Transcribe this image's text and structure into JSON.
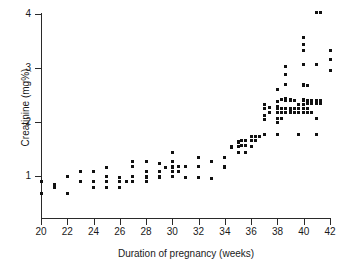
{
  "chart_data": {
    "type": "scatter",
    "title": "",
    "xlabel": "Duration of pregnancy (weeks)",
    "ylabel": "Creatinine (mg%)",
    "xlim": [
      20,
      42
    ],
    "ylim": [
      0.55,
      4.05
    ],
    "grid": false,
    "legend": null,
    "marker": "square",
    "marker_color": "#111111",
    "xticks": [
      20,
      22,
      24,
      26,
      28,
      30,
      32,
      34,
      36,
      38,
      40,
      42
    ],
    "xtick_labels": [
      "20",
      "22",
      "24",
      "26",
      "28",
      "30",
      "32",
      "34",
      "36",
      "38",
      "40",
      "42"
    ],
    "yticks": [
      1,
      2,
      3,
      4
    ],
    "ytick_labels": [
      "1",
      "2",
      "3",
      "4"
    ],
    "x_unit": "weeks",
    "y_unit": "mg%",
    "n_points": 154,
    "points": [
      [
        20.0,
        0.9
      ],
      [
        20.0,
        0.68
      ],
      [
        21.0,
        0.85
      ],
      [
        21.0,
        0.79
      ],
      [
        22.0,
        0.99
      ],
      [
        22.0,
        0.68
      ],
      [
        23.0,
        1.08
      ],
      [
        23.0,
        0.89
      ],
      [
        23.0,
        0.9
      ],
      [
        24.0,
        1.08
      ],
      [
        24.0,
        0.9
      ],
      [
        24.0,
        0.79
      ],
      [
        25.0,
        1.16
      ],
      [
        25.0,
        0.99
      ],
      [
        25.0,
        0.9
      ],
      [
        25.0,
        0.79
      ],
      [
        26.0,
        0.97
      ],
      [
        26.0,
        0.9
      ],
      [
        26.0,
        0.79
      ],
      [
        26.5,
        0.9
      ],
      [
        27.0,
        1.26
      ],
      [
        27.0,
        1.17
      ],
      [
        27.0,
        0.99
      ],
      [
        27.0,
        0.9
      ],
      [
        28.0,
        1.27
      ],
      [
        28.0,
        1.08
      ],
      [
        28.0,
        0.99
      ],
      [
        28.0,
        0.98
      ],
      [
        28.0,
        0.89
      ],
      [
        29.0,
        1.24
      ],
      [
        29.0,
        1.08
      ],
      [
        29.0,
        0.99
      ],
      [
        29.0,
        0.98
      ],
      [
        29.5,
        1.16
      ],
      [
        30.0,
        1.44
      ],
      [
        30.0,
        1.26
      ],
      [
        30.0,
        1.17
      ],
      [
        30.0,
        1.16
      ],
      [
        30.0,
        1.08
      ],
      [
        30.0,
        0.99
      ],
      [
        30.5,
        1.17
      ],
      [
        30.5,
        1.08
      ],
      [
        31.0,
        1.17
      ],
      [
        31.0,
        0.98
      ],
      [
        32.0,
        1.34
      ],
      [
        32.0,
        1.17
      ],
      [
        32.0,
        0.98
      ],
      [
        33.0,
        1.26
      ],
      [
        33.0,
        0.96
      ],
      [
        34.0,
        1.35
      ],
      [
        34.0,
        1.34
      ],
      [
        34.0,
        1.17
      ],
      [
        34.0,
        1.16
      ],
      [
        34.5,
        1.55
      ],
      [
        34.5,
        1.52
      ],
      [
        35.0,
        1.63
      ],
      [
        35.0,
        1.62
      ],
      [
        35.0,
        1.55
      ],
      [
        35.0,
        1.44
      ],
      [
        35.3,
        1.65
      ],
      [
        35.3,
        1.56
      ],
      [
        35.6,
        1.66
      ],
      [
        35.6,
        1.56
      ],
      [
        35.6,
        1.44
      ],
      [
        36.0,
        1.74
      ],
      [
        36.0,
        1.73
      ],
      [
        36.0,
        1.66
      ],
      [
        36.0,
        1.55
      ],
      [
        36.3,
        1.74
      ],
      [
        36.3,
        1.66
      ],
      [
        36.6,
        1.74
      ],
      [
        37.0,
        2.33
      ],
      [
        37.0,
        2.25
      ],
      [
        37.0,
        2.12
      ],
      [
        37.0,
        2.05
      ],
      [
        37.0,
        1.77
      ],
      [
        37.4,
        2.27
      ],
      [
        37.4,
        2.18
      ],
      [
        38.0,
        2.6
      ],
      [
        38.0,
        2.38
      ],
      [
        38.0,
        2.28
      ],
      [
        38.0,
        2.25
      ],
      [
        38.0,
        2.17
      ],
      [
        38.0,
        2.07
      ],
      [
        38.0,
        1.99
      ],
      [
        38.0,
        1.77
      ],
      [
        38.3,
        2.42
      ],
      [
        38.3,
        2.25
      ],
      [
        38.3,
        2.17
      ],
      [
        38.3,
        2.07
      ],
      [
        38.6,
        3.03
      ],
      [
        38.6,
        2.88
      ],
      [
        38.6,
        2.7
      ],
      [
        38.6,
        2.43
      ],
      [
        38.6,
        2.4
      ],
      [
        38.6,
        2.25
      ],
      [
        38.6,
        2.17
      ],
      [
        39.0,
        2.42
      ],
      [
        39.0,
        2.4
      ],
      [
        39.0,
        2.25
      ],
      [
        39.0,
        2.23
      ],
      [
        39.0,
        2.17
      ],
      [
        39.3,
        2.4
      ],
      [
        39.3,
        2.25
      ],
      [
        39.3,
        2.17
      ],
      [
        39.6,
        2.33
      ],
      [
        39.6,
        2.25
      ],
      [
        39.6,
        2.17
      ],
      [
        39.6,
        1.77
      ],
      [
        40.0,
        3.56
      ],
      [
        40.0,
        3.44
      ],
      [
        40.0,
        3.33
      ],
      [
        40.0,
        3.06
      ],
      [
        40.0,
        2.7
      ],
      [
        40.0,
        2.67
      ],
      [
        40.0,
        2.42
      ],
      [
        40.0,
        2.4
      ],
      [
        40.0,
        2.33
      ],
      [
        40.0,
        2.25
      ],
      [
        40.0,
        2.17
      ],
      [
        40.3,
        2.67
      ],
      [
        40.3,
        2.4
      ],
      [
        40.3,
        2.35
      ],
      [
        40.3,
        2.25
      ],
      [
        40.3,
        2.17
      ],
      [
        40.6,
        2.4
      ],
      [
        40.6,
        2.35
      ],
      [
        40.6,
        2.17
      ],
      [
        41.0,
        4.02
      ],
      [
        41.0,
        3.06
      ],
      [
        41.0,
        2.4
      ],
      [
        41.0,
        2.35
      ],
      [
        41.0,
        2.07
      ],
      [
        41.0,
        1.77
      ],
      [
        41.3,
        4.02
      ],
      [
        41.3,
        2.4
      ],
      [
        41.3,
        2.35
      ],
      [
        42.0,
        3.33
      ],
      [
        42.0,
        3.15
      ],
      [
        42.0,
        2.96
      ]
    ]
  }
}
